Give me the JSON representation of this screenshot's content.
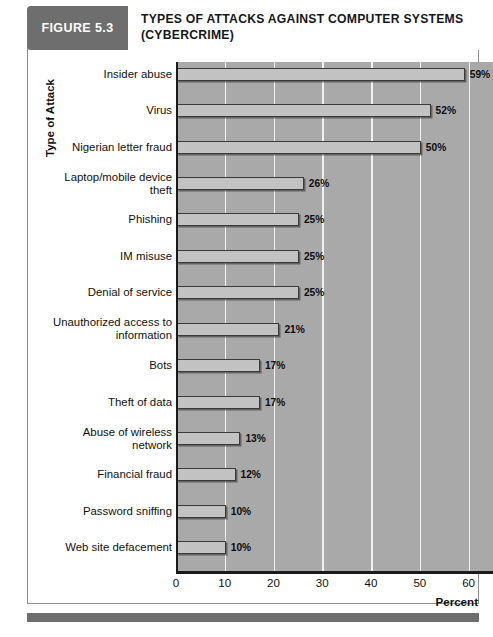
{
  "header": {
    "figure_tag": "FIGURE 5.3",
    "title_line1": "TYPES OF ATTACKS AGAINST COMPUTER SYSTEMS",
    "title_line2": "(CYBERCRIME)",
    "tag_bg": "#6e6e6e"
  },
  "chart_data": {
    "type": "bar",
    "orientation": "horizontal",
    "title": "TYPES OF ATTACKS AGAINST COMPUTER SYSTEMS (CYBERCRIME)",
    "xlabel": "Percent",
    "ylabel": "Type of Attack",
    "xlim": [
      0,
      65
    ],
    "xticks": [
      0,
      10,
      20,
      30,
      40,
      50,
      60
    ],
    "xtick_labels": [
      "0",
      "10",
      "20",
      "30",
      "40",
      "50",
      "60"
    ],
    "grid": "vertical",
    "legend": "none",
    "plot_bg": "#a9a9a9",
    "bar_fill": "#c2c2c2",
    "bar_border": "#3a3a3a",
    "gridline_color": "#f2f2f2",
    "categories": [
      "Insider abuse",
      "Virus",
      "Nigerian letter fraud",
      "Laptop/mobile device theft",
      "Phishing",
      "IM misuse",
      "Denial of service",
      "Unauthorized access to information",
      "Bots",
      "Theft of data",
      "Abuse of wireless network",
      "Financial fraud",
      "Password sniffing",
      "Web site defacement"
    ],
    "values": [
      59,
      52,
      50,
      26,
      25,
      25,
      25,
      21,
      17,
      17,
      13,
      12,
      10,
      10
    ],
    "value_labels": [
      "59%",
      "52%",
      "50%",
      "26%",
      "25%",
      "25%",
      "25%",
      "21%",
      "17%",
      "17%",
      "13%",
      "12%",
      "10%",
      "10%"
    ],
    "category_label_lines": [
      [
        "Insider abuse"
      ],
      [
        "Virus"
      ],
      [
        "Nigerian letter fraud"
      ],
      [
        "Laptop/mobile device",
        "theft"
      ],
      [
        "Phishing"
      ],
      [
        "IM misuse"
      ],
      [
        "Denial of service"
      ],
      [
        "Unauthorized access to",
        "information"
      ],
      [
        "Bots"
      ],
      [
        "Theft of data"
      ],
      [
        "Abuse of wireless",
        "network"
      ],
      [
        "Financial fraud"
      ],
      [
        "Password sniffing"
      ],
      [
        "Web site defacement"
      ]
    ]
  }
}
